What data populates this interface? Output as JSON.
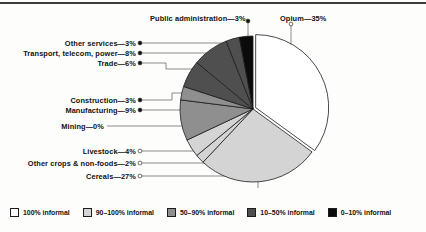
{
  "chart_data": {
    "type": "pie",
    "title": "",
    "subtitle": "",
    "xlabel": "",
    "ylabel": "",
    "legend_position": "bottom",
    "grid": false,
    "total_percent": 100,
    "start_angle_deg": 0,
    "direction": "clockwise",
    "categories": [
      "Opium",
      "Cereals",
      "Other crops & non-foods",
      "Livestock",
      "Mining",
      "Manufacturing",
      "Construction",
      "Trade",
      "Transport, telecom, power",
      "Other services",
      "Public administration"
    ],
    "values": [
      35,
      27,
      2,
      4,
      0,
      9,
      3,
      6,
      8,
      3,
      3
    ],
    "value_labels": [
      "35%",
      "27%",
      "2%",
      "4%",
      "0%",
      "9%",
      "3%",
      "6%",
      "8%",
      "3%",
      "3%"
    ],
    "slices": [
      {
        "label": "Opium",
        "value": 35,
        "value_label": "35%",
        "text": "Opium—35%",
        "informality": "100% informal",
        "color": "#ffffff",
        "marker": "hollow"
      },
      {
        "label": "Cereals",
        "value": 27,
        "value_label": "27%",
        "text": "Cereals—27%",
        "informality": "90–100% informal",
        "color": "#d4d4d4",
        "marker": "hollow"
      },
      {
        "label": "Other crops & non-foods",
        "value": 2,
        "value_label": "2%",
        "text": "Other crops & non-foods—2%",
        "informality": "90–100% informal",
        "color": "#d4d4d4",
        "marker": "hollow"
      },
      {
        "label": "Livestock",
        "value": 4,
        "value_label": "4%",
        "text": "Livestock—4%",
        "informality": "90–100% informal",
        "color": "#d4d4d4",
        "marker": "hollow"
      },
      {
        "label": "Mining",
        "value": 0,
        "value_label": "0%",
        "text": "Mining—0%",
        "informality": "50–90% informal",
        "color": "#8f8f8f",
        "marker": "none"
      },
      {
        "label": "Manufacturing",
        "value": 9,
        "value_label": "9%",
        "text": "Manufacturing—9%",
        "informality": "50–90% informal",
        "color": "#8f8f8f",
        "marker": "filled"
      },
      {
        "label": "Construction",
        "value": 3,
        "value_label": "3%",
        "text": "Construction—3%",
        "informality": "50–90% informal",
        "color": "#8f8f8f",
        "marker": "filled"
      },
      {
        "label": "Trade",
        "value": 6,
        "value_label": "6%",
        "text": "Trade—6%",
        "informality": "10–50% informal",
        "color": "#4f4f4f",
        "marker": "filled"
      },
      {
        "label": "Transport, telecom, power",
        "value": 8,
        "value_label": "8%",
        "text": "Transport, telecom, power—8%",
        "informality": "10–50% informal",
        "color": "#4f4f4f",
        "marker": "filled"
      },
      {
        "label": "Other services",
        "value": 3,
        "value_label": "3%",
        "text": "Other services—3%",
        "informality": "10–50% informal",
        "color": "#4f4f4f",
        "marker": "filled"
      },
      {
        "label": "Public administration",
        "value": 3,
        "value_label": "3%",
        "text": "Public administration—3%",
        "informality": "0–10% informal",
        "color": "#0b0b0b",
        "marker": "filled"
      }
    ]
  },
  "labels": {
    "public_administration": "Public administration—3%",
    "opium": "Opium—35%",
    "other_services": "Other services—3%",
    "transport": "Transport, telecom, power—8%",
    "trade": "Trade—6%",
    "construction": "Construction—3%",
    "manufacturing": "Manufacturing—9%",
    "mining": "Mining—0%",
    "livestock": "Livestock—4%",
    "other_crops": "Other crops & non-foods—2%",
    "cereals": "Cereals—27%"
  },
  "legend": {
    "items": [
      {
        "label": "100% informal",
        "color": "#ffffff"
      },
      {
        "label": "90–100% informal",
        "color": "#d4d4d4"
      },
      {
        "label": "50–90% informal",
        "color": "#8f8f8f"
      },
      {
        "label": "10–50% informal",
        "color": "#4f4f4f"
      },
      {
        "label": "0–10% informal",
        "color": "#0b0b0b"
      }
    ]
  }
}
